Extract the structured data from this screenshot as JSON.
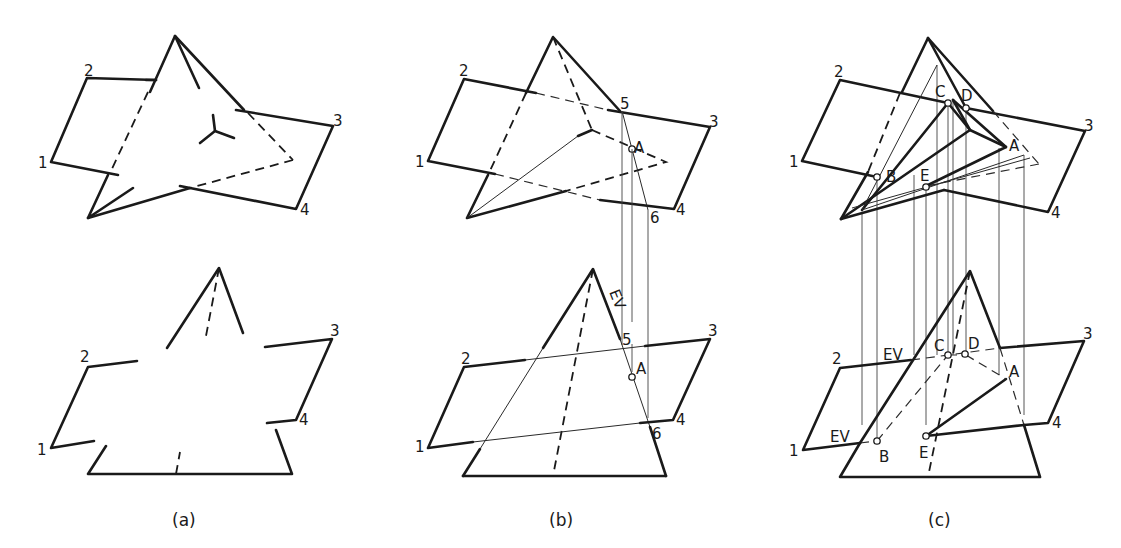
{
  "figure": {
    "type": "orthographic-projection-diagram",
    "panels": [
      {
        "id": "a",
        "caption": "(a)",
        "top_view_labels": [
          "1",
          "2",
          "3",
          "4"
        ],
        "front_view_labels": [
          "1",
          "2",
          "3",
          "4"
        ]
      },
      {
        "id": "b",
        "caption": "(b)",
        "top_view_labels": [
          "1",
          "2",
          "3",
          "4",
          "5",
          "6",
          "A"
        ],
        "front_view_labels": [
          "1",
          "2",
          "3",
          "4",
          "5",
          "6",
          "A",
          "EV"
        ]
      },
      {
        "id": "c",
        "caption": "(c)",
        "top_view_labels": [
          "1",
          "2",
          "3",
          "4",
          "A",
          "B",
          "C",
          "D",
          "E"
        ],
        "front_view_labels": [
          "1",
          "2",
          "3",
          "4",
          "A",
          "B",
          "C",
          "D",
          "E",
          "EV",
          "EV"
        ]
      }
    ]
  },
  "labels": {
    "n1": "1",
    "n2": "2",
    "n3": "3",
    "n4": "4",
    "n5": "5",
    "n6": "6",
    "A": "A",
    "B": "B",
    "C": "C",
    "D": "D",
    "E": "E",
    "EV": "EV"
  },
  "captions": {
    "a": "(a)",
    "b": "(b)",
    "c": "(c)"
  }
}
